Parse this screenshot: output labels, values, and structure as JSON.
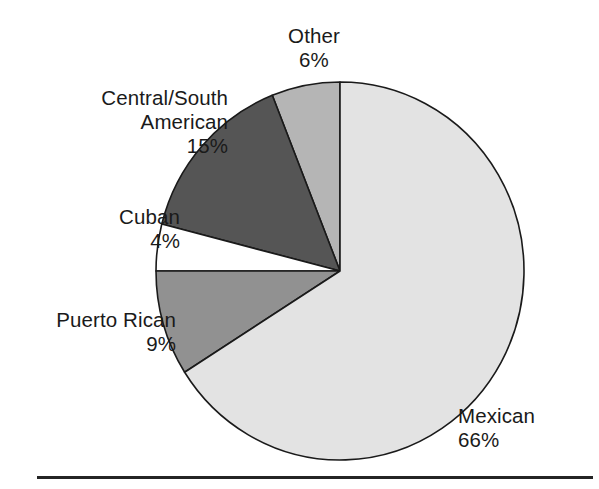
{
  "chart_data": {
    "type": "pie",
    "title": "",
    "subtitle": "",
    "xlabel": "",
    "ylabel": "",
    "legend_position": "none",
    "grid": false,
    "label_format": "name + percent",
    "categories": [
      "Other",
      "Central/South American",
      "Cuban",
      "Puerto Rican",
      "Mexican"
    ],
    "values": [
      6,
      15,
      4,
      9,
      66
    ],
    "units": "%",
    "start_angle_deg": 90,
    "direction": "counterclockwise",
    "slices": [
      {
        "name": "Other",
        "label_lines": [
          "Other"
        ],
        "value": 6,
        "percent_text": "6%",
        "color": "#b5b5b5"
      },
      {
        "name": "Central/South American",
        "label_lines": [
          "Central/South",
          "American"
        ],
        "value": 15,
        "percent_text": "15%",
        "color": "#555555"
      },
      {
        "name": "Cuban",
        "label_lines": [
          "Cuban"
        ],
        "value": 4,
        "percent_text": "4%",
        "color": "#ffffff"
      },
      {
        "name": "Puerto Rican",
        "label_lines": [
          "Puerto Rican"
        ],
        "value": 9,
        "percent_text": "9%",
        "color": "#919191"
      },
      {
        "name": "Mexican",
        "label_lines": [
          "Mexican"
        ],
        "value": 66,
        "percent_text": "66%",
        "color": "#e3e3e3"
      }
    ],
    "stroke_color": "#1a1a1a",
    "background_color": "#ffffff"
  },
  "labels": {
    "other": {
      "name": "Other",
      "percent": "6%"
    },
    "central_south_american": {
      "line1": "Central/South",
      "line2": "American",
      "percent": "15%"
    },
    "cuban": {
      "name": "Cuban",
      "percent": "4%"
    },
    "puerto_rican": {
      "name": "Puerto Rican",
      "percent": "9%"
    },
    "mexican": {
      "name": "Mexican",
      "percent": "66%"
    }
  }
}
